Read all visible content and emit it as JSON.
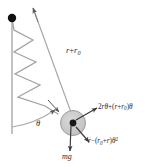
{
  "figure": {
    "kind": "spring-pendulum-free-body-diagram",
    "background_color": "#ffffff",
    "stroke_color": "#8c8c8c",
    "dark_stroke_color": "#3a3a3a",
    "bob_fill_color": "#c9c9c9",
    "bob_edge_color": "#8c8c8c",
    "pivot_color": "#111111",
    "label_color": "#2b2b2b"
  },
  "labels": {
    "rod_length": {
      "text": "r + r0",
      "parts": {
        "r": "r",
        "plus": "+",
        "r_base": "r",
        "r_sub": "0"
      }
    },
    "angle": {
      "text": "θ",
      "symbol": "θ"
    },
    "tangential_acceleration": {
      "text": "2rθ̇ + (r + r0)θ̈",
      "parts": {
        "coefficient": "2",
        "r": "r",
        "theta_dot": "θ",
        "dot_single": "˙",
        "plus": "+",
        "open_paren": "(",
        "r2": "r",
        "plus2": "+",
        "r0_base": "r",
        "r0_sub": "0",
        "close_paren": ")",
        "theta_ddot": "θ",
        "dot_double": "˙˙"
      }
    },
    "radial_acceleration": {
      "text": "r̈ − (r0 + r)θ̇²",
      "parts": {
        "r_ddot": "r",
        "dot_double": "˙˙",
        "minus": "−",
        "open_paren": "(",
        "r0_base": "r",
        "r0_sub": "0",
        "plus": "+",
        "r2": "r",
        "close_paren": ")",
        "theta": "θ",
        "dot_single": "˙",
        "exponent": "2"
      }
    },
    "weight": {
      "text": "mg",
      "parts": {
        "m": "m",
        "g": "g"
      }
    }
  },
  "elements": {
    "pivot": {
      "name": "pivot-point",
      "cx": 12,
      "cy": 18,
      "r": 4.2
    },
    "bob": {
      "name": "mass-bob",
      "cx": 73,
      "cy": 123,
      "r": 12.5,
      "center_dot_r": 3.4
    },
    "vertical_reference_line": {
      "x": 12,
      "y1": 18,
      "y2": 134
    },
    "rod_line": {
      "x1": 33,
      "y1": 8,
      "x2": 73,
      "y2": 123
    },
    "angle_arc": {
      "label": "theta-arc"
    },
    "spring": {
      "name": "spring-coil",
      "turns": 4
    }
  }
}
